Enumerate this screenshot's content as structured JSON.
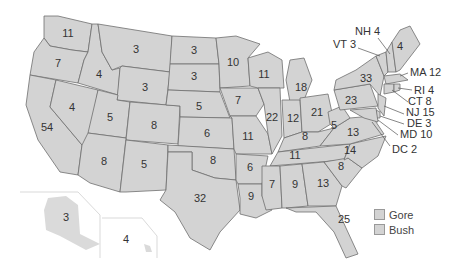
{
  "legend": [
    {
      "label": "Gore",
      "color": "#d3d3d3"
    },
    {
      "label": "Bush",
      "color": "#d3d3d3"
    }
  ],
  "states": {
    "WA": "11",
    "OR": "7",
    "CA": "54",
    "NV": "4",
    "ID": "4",
    "MT": "3",
    "WY": "3",
    "UT": "5",
    "CO": "8",
    "AZ": "8",
    "NM": "5",
    "ND": "3",
    "SD": "3",
    "NE": "5",
    "KS": "6",
    "OK": "8",
    "TX": "32",
    "MN": "10",
    "IA": "7",
    "MO": "11",
    "AR": "6",
    "LA": "9",
    "WI": "11",
    "IL": "22",
    "MI": "18",
    "IN": "12",
    "OH": "21",
    "KY": "8",
    "TN": "11",
    "MS": "7",
    "AL": "9",
    "GA": "13",
    "FL": "25",
    "SC": "8",
    "NC": "14",
    "VA": "13",
    "WV": "5",
    "PA": "23",
    "NY": "33",
    "ME": "4",
    "AK": "3",
    "HI": "4"
  },
  "callouts": {
    "NH": "NH 4",
    "VT": "VT 3",
    "MA": "MA 12",
    "RI": "RI 4",
    "CT": "CT 8",
    "NJ": "NJ 15",
    "DE": "DE 3",
    "MD": "MD 10",
    "DC": "DC 2"
  }
}
